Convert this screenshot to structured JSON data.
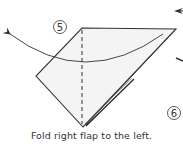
{
  "diagram": {
    "type": "origami-instruction",
    "steps": [
      {
        "number": "5",
        "label": "step-5"
      },
      {
        "number": "6",
        "label": "step-6"
      }
    ],
    "caption": "Fold right flap to the left.",
    "colors": {
      "paper_fill": "#f4f4f4",
      "line": "#333333",
      "background": "#ffffff"
    }
  }
}
